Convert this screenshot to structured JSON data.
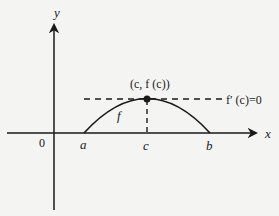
{
  "diagram": {
    "type": "function-graph",
    "axes": {
      "x_label": "x",
      "y_label": "y",
      "origin_label": "0"
    },
    "points": {
      "a_label": "a",
      "c_label": "c",
      "b_label": "b"
    },
    "curve": {
      "label": "f"
    },
    "annotations": {
      "max_point_label": "(c, f (c))",
      "tangent_label": "f′ (c)=0"
    },
    "colors": {
      "ink": "#1a1a1a",
      "background": "#f4f4f2"
    }
  }
}
